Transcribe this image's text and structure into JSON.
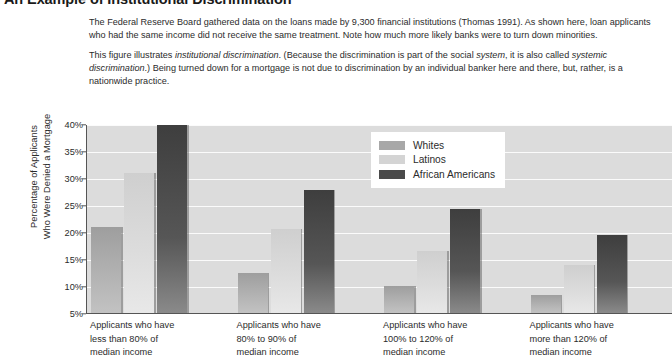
{
  "figure": {
    "title": "An Example of Institutional Discrimination",
    "paragraphs": [
      {
        "runs": [
          {
            "text": "The Federal Reserve Board gathered data on the loans made by 9,300 financial institutions (Thomas 1991). As shown here, loan applicants who had the same income did not receive the same treatment. Note how much more likely banks were to turn down minorities.",
            "italic": false
          }
        ]
      },
      {
        "runs": [
          {
            "text": "This figure illustrates ",
            "italic": false
          },
          {
            "text": "institutional discrimination",
            "italic": true
          },
          {
            "text": ". (Because the discrimination is part of the social ",
            "italic": false
          },
          {
            "text": "system",
            "italic": true
          },
          {
            "text": ", it is also called ",
            "italic": false
          },
          {
            "text": "systemic discrimination",
            "italic": true
          },
          {
            "text": ".) Being turned down for a mortgage is not due to discrimination by an individual banker here and there, but, rather, is a nationwide practice.",
            "italic": false
          }
        ]
      }
    ]
  },
  "chart_data": {
    "type": "bar",
    "title": "An Example of Institutional Discrimination",
    "xlabel": "",
    "ylabel": "Percentage of Applicants Who Were Denied a Mortgage",
    "ylabel_line1": "Percentage of Applicants",
    "ylabel_line2": "Who Were Denied a Mortgage",
    "ylim": [
      5,
      40
    ],
    "ytick_labels": [
      "40%",
      "35%",
      "30%",
      "25%",
      "20%",
      "15%",
      "10%",
      "5%"
    ],
    "ytick_values": [
      40,
      35,
      30,
      25,
      20,
      15,
      10,
      5
    ],
    "grid": true,
    "legend_position": "upper right",
    "categories": [
      "Applicants who have less than 80% of median income",
      "Applicants who have 80% to 90% of median income",
      "Applicants who have 100% to 120% of median income",
      "Applicants who have more than 120% of median income"
    ],
    "category_lines": [
      [
        "Applicants who have",
        "less than 80% of",
        "median income"
      ],
      [
        "Applicants who have",
        "80% to 90% of",
        "median income"
      ],
      [
        "Applicants who have",
        "100% to 120% of",
        "median income"
      ],
      [
        "Applicants who have",
        "more than 120% of",
        "median income"
      ]
    ],
    "series": [
      {
        "name": "Whites",
        "color": "#a8a8a8",
        "values": [
          21.0,
          12.5,
          10.0,
          8.3
        ],
        "unit": "%"
      },
      {
        "name": "Latinos",
        "color": "#d4d4d4",
        "values": [
          31.0,
          20.5,
          16.5,
          13.8
        ],
        "unit": "%"
      },
      {
        "name": "African Americans",
        "color": "#4a4a4a",
        "values": [
          40.0,
          27.8,
          24.3,
          19.5
        ],
        "unit": "%"
      }
    ],
    "plot_background": "#dcdcdc",
    "axis_color": "#555555",
    "gridline_color": "#fbfbfb"
  }
}
